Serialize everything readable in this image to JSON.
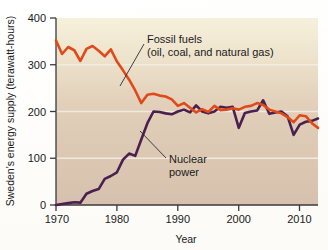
{
  "chart_data": {
    "type": "line",
    "title": "",
    "xlabel": "Year",
    "ylabel": "Sweden's energy supply (terawatt-hours)",
    "xlim": [
      1970,
      2013
    ],
    "ylim": [
      0,
      400
    ],
    "xticks": [
      "1970",
      "1980",
      "1990",
      "2000",
      "2010"
    ],
    "xtick_values": [
      1970,
      1980,
      1990,
      2000,
      2010
    ],
    "yticks": [
      "0",
      "100",
      "200",
      "300",
      "400"
    ],
    "ytick_values": [
      0,
      100,
      200,
      300,
      400
    ],
    "grid": "horizontal-faint",
    "legend": "inline-annotations",
    "x": [
      1970,
      1971,
      1972,
      1973,
      1974,
      1975,
      1976,
      1977,
      1978,
      1979,
      1980,
      1981,
      1982,
      1983,
      1984,
      1985,
      1986,
      1987,
      1988,
      1989,
      1990,
      1991,
      1992,
      1993,
      1994,
      1995,
      1996,
      1997,
      1998,
      1999,
      2000,
      2001,
      2002,
      2003,
      2004,
      2005,
      2006,
      2007,
      2008,
      2009,
      2010,
      2011,
      2012,
      2013
    ],
    "series": [
      {
        "name": "Fossil fuels",
        "label": "Fossil fuels",
        "sublabel": "(oil, coal, and natural gas)",
        "color": "#e04a18",
        "values": [
          352,
          323,
          338,
          331,
          308,
          334,
          340,
          330,
          318,
          333,
          307,
          288,
          268,
          245,
          218,
          236,
          238,
          234,
          232,
          226,
          212,
          218,
          208,
          198,
          205,
          199,
          212,
          203,
          204,
          207,
          204,
          210,
          212,
          218,
          214,
          204,
          200,
          196,
          188,
          177,
          192,
          190,
          175,
          165
        ]
      },
      {
        "name": "Nuclear power",
        "label": "Nuclear",
        "sublabel": "power",
        "color": "#4a2050",
        "values": [
          0,
          2,
          4,
          6,
          5,
          24,
          30,
          34,
          56,
          62,
          70,
          97,
          110,
          105,
          140,
          175,
          200,
          199,
          196,
          194,
          200,
          204,
          198,
          213,
          200,
          196,
          200,
          210,
          208,
          210,
          165,
          197,
          200,
          202,
          224,
          195,
          198,
          200,
          190,
          150,
          172,
          178,
          180,
          185
        ]
      }
    ],
    "annotations": [
      {
        "name": "fossil-fuels-annotation",
        "line1": "Fossil fuels",
        "line2": "(oil, coal, and natural gas)"
      },
      {
        "name": "nuclear-power-annotation",
        "line1": "Nuclear",
        "line2": "power"
      }
    ],
    "colors": {
      "fossil": "#e04a18",
      "nuclear": "#4a2050",
      "plot_top": "#f5efdb",
      "plot_bottom": "#d6c2ae",
      "axis": "#3a3a3a",
      "grid": "#f2eee4"
    }
  }
}
